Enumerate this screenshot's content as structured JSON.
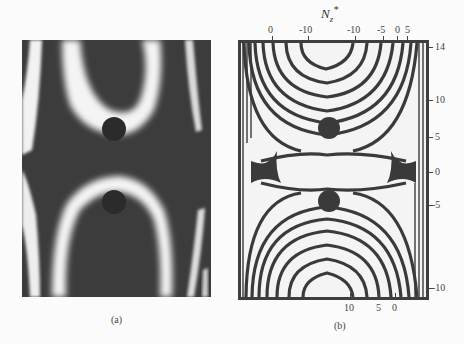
{
  "figure": {
    "panel_a": {
      "caption": "(a)"
    },
    "panel_b": {
      "caption": "(b)",
      "axis_title": "N",
      "axis_title_sub": "z",
      "axis_title_sup": "*",
      "top_ticks": [
        "0",
        "-10",
        "-10",
        "-5",
        "0",
        "5"
      ],
      "right_ticks": [
        "14",
        "10",
        "5",
        "0",
        "-5",
        "-10"
      ],
      "bottom_ticks": [
        "10",
        "5",
        "0"
      ]
    }
  },
  "colors": {
    "dark": "#3a3a3a",
    "light": "#f3f3f3",
    "frame": "#3e3e3e"
  }
}
